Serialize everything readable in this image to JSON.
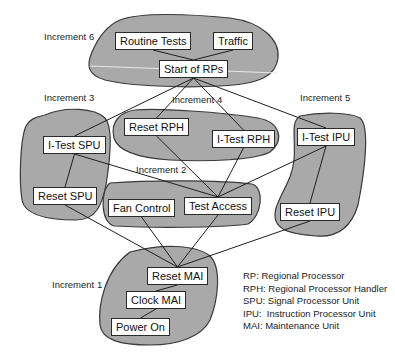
{
  "diagram": {
    "type": "dependency-graph",
    "increments": [
      {
        "id": "inc6",
        "label": "Increment 6",
        "label_pos": [
          44,
          37
        ]
      },
      {
        "id": "inc3",
        "label": "Increment 3",
        "label_pos": [
          44,
          98
        ]
      },
      {
        "id": "inc4",
        "label": "Increment 4",
        "label_pos": [
          172,
          100
        ]
      },
      {
        "id": "inc5",
        "label": "Increment 5",
        "label_pos": [
          300,
          98
        ]
      },
      {
        "id": "inc2",
        "label": "Increment 2",
        "label_pos": [
          136,
          170
        ]
      },
      {
        "id": "inc1",
        "label": "Increment 1",
        "label_pos": [
          52,
          285
        ]
      }
    ],
    "nodes": [
      {
        "id": "routine_tests",
        "label": "Routine Tests",
        "increment": "inc6",
        "x": 115,
        "y": 32
      },
      {
        "id": "traffic",
        "label": "Traffic",
        "increment": "inc6",
        "x": 213,
        "y": 32
      },
      {
        "id": "start_rps",
        "label": "Start of RPs",
        "increment": "inc6",
        "x": 159,
        "y": 60
      },
      {
        "id": "itest_spu",
        "label": "I-Test SPU",
        "increment": "inc3",
        "x": 43,
        "y": 136
      },
      {
        "id": "reset_spu",
        "label": "Reset SPU",
        "increment": "inc3",
        "x": 33,
        "y": 187
      },
      {
        "id": "reset_rph",
        "label": "Reset RPH",
        "increment": "inc4",
        "x": 124,
        "y": 118
      },
      {
        "id": "itest_rph",
        "label": "I-Test RPH",
        "increment": "inc4",
        "x": 212,
        "y": 130
      },
      {
        "id": "itest_ipu",
        "label": "I-Test IPU",
        "increment": "inc5",
        "x": 297,
        "y": 128
      },
      {
        "id": "reset_ipu",
        "label": "Reset IPU",
        "increment": "inc5",
        "x": 280,
        "y": 203
      },
      {
        "id": "fan_control",
        "label": "Fan Control",
        "increment": "inc2",
        "x": 108,
        "y": 199
      },
      {
        "id": "test_access",
        "label": "Test Access",
        "increment": "inc2",
        "x": 184,
        "y": 197
      },
      {
        "id": "reset_mai",
        "label": "Reset MAI",
        "increment": "inc1",
        "x": 147,
        "y": 267
      },
      {
        "id": "clock_mai",
        "label": "Clock MAI",
        "increment": "inc1",
        "x": 126,
        "y": 291
      },
      {
        "id": "power_on",
        "label": "Power On",
        "increment": "inc1",
        "x": 111,
        "y": 318
      }
    ],
    "edges": [
      [
        "routine_tests",
        "start_rps"
      ],
      [
        "traffic",
        "start_rps"
      ],
      [
        "start_rps",
        "itest_spu"
      ],
      [
        "start_rps",
        "reset_rph"
      ],
      [
        "start_rps",
        "itest_rph"
      ],
      [
        "start_rps",
        "itest_ipu"
      ],
      [
        "itest_spu",
        "reset_spu"
      ],
      [
        "itest_spu",
        "test_access"
      ],
      [
        "reset_rph",
        "test_access"
      ],
      [
        "itest_rph",
        "test_access"
      ],
      [
        "itest_ipu",
        "test_access"
      ],
      [
        "itest_ipu",
        "reset_ipu"
      ],
      [
        "reset_spu",
        "reset_mai"
      ],
      [
        "fan_control",
        "reset_mai"
      ],
      [
        "test_access",
        "reset_mai"
      ],
      [
        "reset_ipu",
        "reset_mai"
      ],
      [
        "reset_mai",
        "clock_mai"
      ],
      [
        "clock_mai",
        "power_on"
      ]
    ]
  },
  "legend": [
    "RP: Regional Processor",
    "RPH: Regional Processor Handler",
    "SPU: Signal Processor Unit",
    "IPU:  Instruction Processor Unit",
    "MAI: Maintenance Unit"
  ],
  "colors": {
    "blob_fill": "#a9a9a9",
    "blob_stroke": "#3a3a3a",
    "node_fill": "#ffffff",
    "edge": "#1e1e1e"
  }
}
